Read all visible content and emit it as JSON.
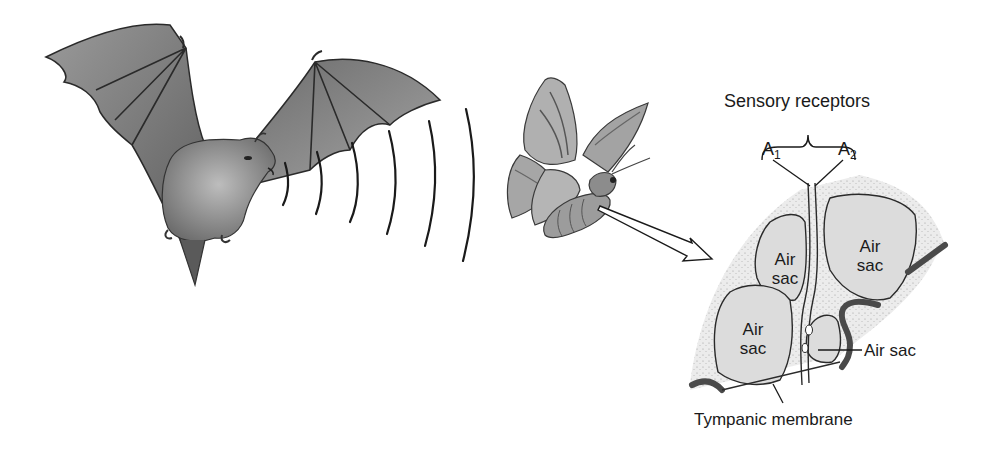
{
  "diagram": {
    "labels": {
      "sensory_receptors": "Sensory receptors",
      "receptor_a1": "A",
      "receptor_a1_sub": "1",
      "receptor_a2": "A",
      "receptor_a2_sub": "2",
      "air_sac_upper_left_line1": "Air",
      "air_sac_upper_left_line2": "sac",
      "air_sac_upper_right_line1": "Air",
      "air_sac_upper_right_line2": "sac",
      "air_sac_lower_left_line1": "Air",
      "air_sac_lower_left_line2": "sac",
      "air_sac_callout": "Air sac",
      "tympanic_membrane": "Tympanic membrane"
    },
    "figures": [
      "bat",
      "sound-waves",
      "moth",
      "arrow",
      "ear-cross-section"
    ],
    "sound_wave_count": 6,
    "colors": {
      "ink": "#1a1a1a",
      "tissue_fill": "#e6e6e6",
      "sac_fill": "#d9d9d9",
      "membrane": "#4a4a4a",
      "bat_fill": "#8a8a8a",
      "moth_fill": "#a8a8a8"
    }
  }
}
